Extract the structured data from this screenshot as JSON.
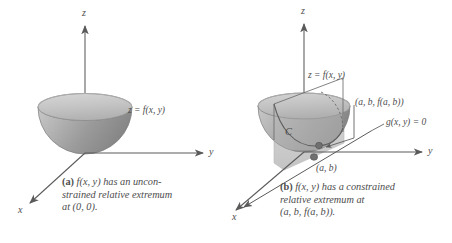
{
  "figure": {
    "background_color": "#ffffff",
    "ink_color": "#4d4d4d",
    "surface_color_light": "#c2c2c2",
    "surface_color_dark": "#8a8a8a",
    "plane_color": "#c9c9c9",
    "point_color": "#6e6e6e"
  },
  "panel_a": {
    "axes": {
      "z_label": "z",
      "y_label": "y",
      "x_label": "x"
    },
    "surface_label": "z = f(x, y)",
    "caption_prefix": "(a)",
    "caption_text": " f(x, y) has an uncon-\nstrained relative extremum\nat (0, 0)."
  },
  "panel_b": {
    "axes": {
      "z_label": "z",
      "y_label": "y",
      "x_label": "x"
    },
    "surface_label": "z = f(x, y)",
    "point_3d_label": "(a, b, f(a, b))",
    "constraint_label": "g(x, y) = 0",
    "curve_label": "C",
    "point_2d_label": "(a, b)",
    "caption_prefix": "(b)",
    "caption_text": " f(x, y) has a constrained\nrelative extremum at\n(a, b, f(a, b))."
  }
}
